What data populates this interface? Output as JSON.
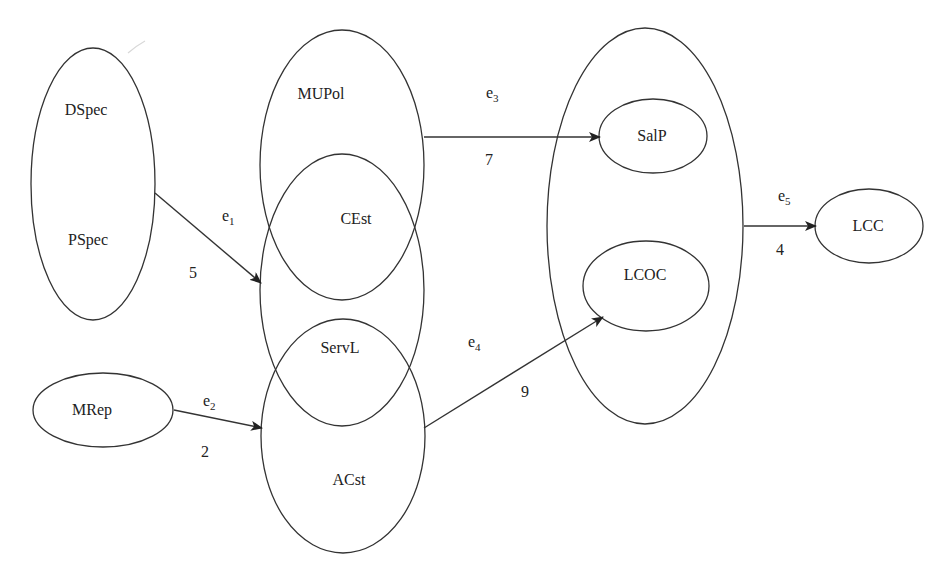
{
  "diagram": {
    "width": 951,
    "height": 581,
    "stroke_color": "#333333",
    "text_color": "#222222",
    "background": "#ffffff",
    "groups": [
      {
        "id": "spec-group",
        "cx": 93,
        "cy": 184,
        "rx": 62,
        "ry": 136
      },
      {
        "id": "mupol-group",
        "cx": 342,
        "cy": 165,
        "rx": 82,
        "ry": 135
      },
      {
        "id": "cest-servl-group",
        "cx": 342,
        "cy": 290,
        "rx": 82,
        "ry": 136
      },
      {
        "id": "acst-group",
        "cx": 343,
        "cy": 436,
        "rx": 82,
        "ry": 117
      },
      {
        "id": "output-group",
        "cx": 645,
        "cy": 226,
        "rx": 98,
        "ry": 198
      }
    ],
    "nodes": [
      {
        "id": "mrep",
        "label": "MRep",
        "cx": 103,
        "cy": 410,
        "rx": 70,
        "ry": 37
      },
      {
        "id": "salp",
        "label": "SalP",
        "cx": 653,
        "cy": 136,
        "rx": 54,
        "ry": 37
      },
      {
        "id": "lcoc",
        "label": "LCOC",
        "cx": 646,
        "cy": 286,
        "rx": 63,
        "ry": 45
      },
      {
        "id": "lcc",
        "label": "LCC",
        "cx": 869,
        "cy": 226,
        "rx": 54,
        "ry": 37
      }
    ],
    "labels": [
      {
        "id": "dspec",
        "text": "DSpec",
        "x": 86,
        "y": 115
      },
      {
        "id": "pspec",
        "text": "PSpec",
        "x": 88,
        "y": 245
      },
      {
        "id": "mupol",
        "text": "MUPol",
        "x": 321,
        "y": 99
      },
      {
        "id": "cest",
        "text": "CEst",
        "x": 356,
        "y": 224
      },
      {
        "id": "servl",
        "text": "ServL",
        "x": 340,
        "y": 353
      },
      {
        "id": "acst",
        "text": "ACst",
        "x": 349,
        "y": 485
      },
      {
        "id": "mrep",
        "text": "MRep",
        "x": 92,
        "y": 415
      },
      {
        "id": "salp",
        "text": "SalP",
        "x": 652,
        "y": 141
      },
      {
        "id": "lcoc",
        "text": "LCOC",
        "x": 645,
        "y": 280
      },
      {
        "id": "lcc",
        "text": "LCC",
        "x": 868,
        "y": 231
      }
    ],
    "edges": [
      {
        "id": "e1",
        "name": "e",
        "sub": "1",
        "weight": "5",
        "x1": 155,
        "y1": 193,
        "x2": 261,
        "y2": 283,
        "name_x": 222,
        "name_y": 221,
        "weight_x": 193,
        "weight_y": 278
      },
      {
        "id": "e2",
        "name": "e",
        "sub": "2",
        "weight": "2",
        "x1": 174,
        "y1": 410,
        "x2": 262,
        "y2": 428,
        "name_x": 203,
        "name_y": 406,
        "weight_x": 205,
        "weight_y": 457
      },
      {
        "id": "e3",
        "name": "e",
        "sub": "3",
        "weight": "7",
        "x1": 424,
        "y1": 137,
        "x2": 600,
        "y2": 137,
        "name_x": 486,
        "name_y": 98,
        "weight_x": 489,
        "weight_y": 165
      },
      {
        "id": "e4",
        "name": "e",
        "sub": "4",
        "weight": "9",
        "x1": 424,
        "y1": 428,
        "x2": 603,
        "y2": 317,
        "name_x": 468,
        "name_y": 347,
        "weight_x": 525,
        "weight_y": 397
      },
      {
        "id": "e5",
        "name": "e",
        "sub": "5",
        "weight": "4",
        "x1": 744,
        "y1": 226,
        "x2": 816,
        "y2": 226,
        "name_x": 778,
        "name_y": 201,
        "weight_x": 780,
        "weight_y": 255
      }
    ]
  }
}
